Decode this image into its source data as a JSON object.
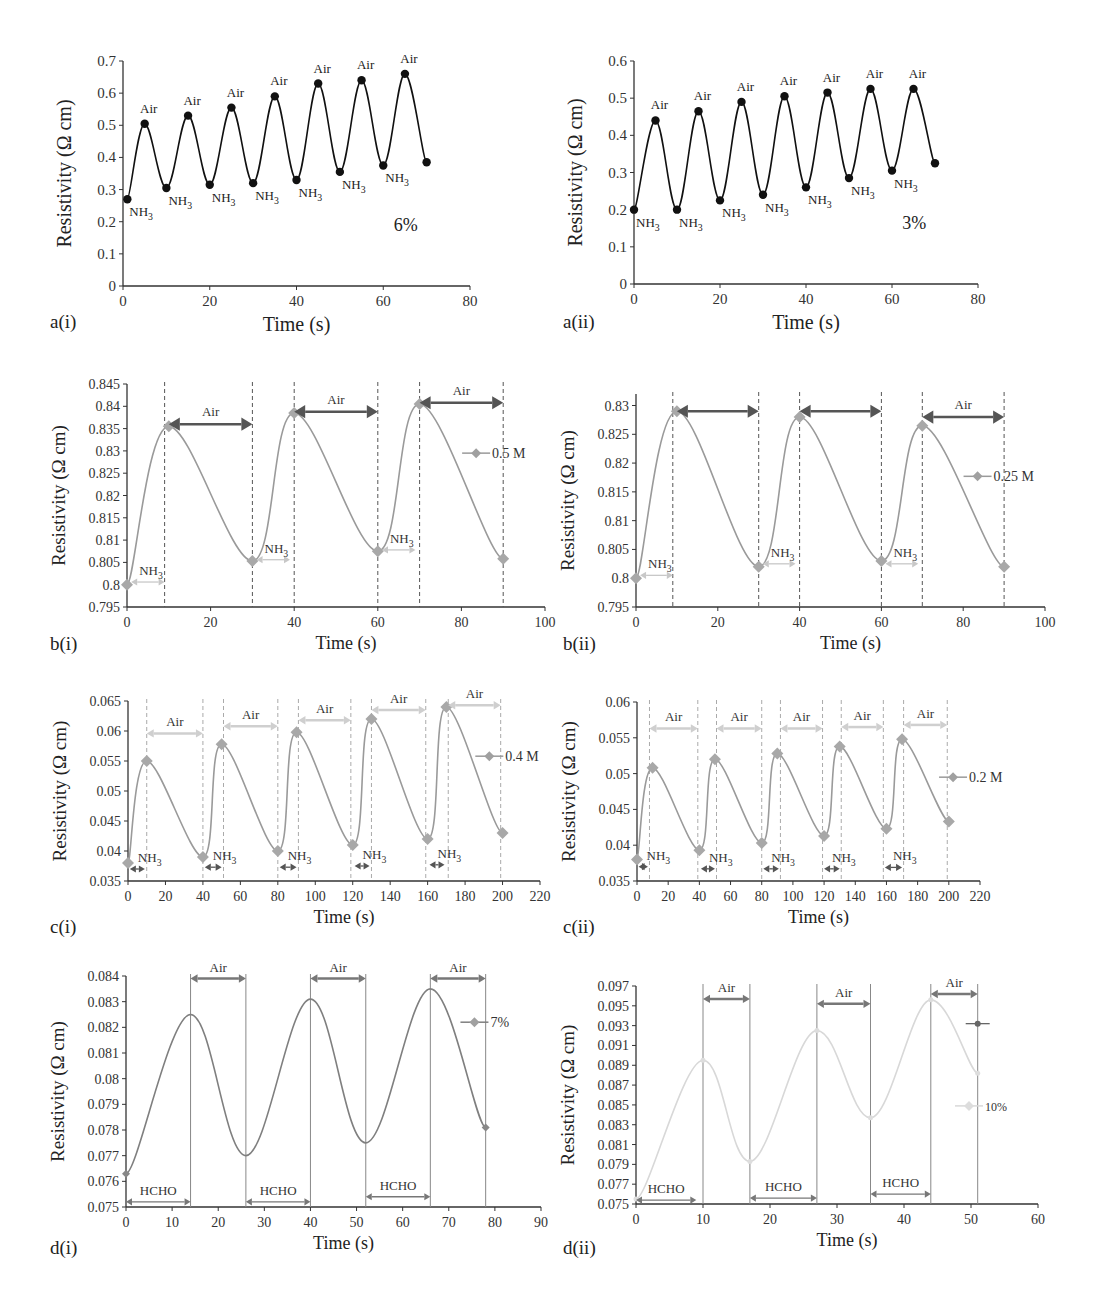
{
  "figure": {
    "panels": [
      "a(i)",
      "a(ii)",
      "b(i)",
      "b(ii)",
      "c(i)",
      "c(ii)",
      "d(i)",
      "d(ii)"
    ]
  },
  "chart_data": [
    {
      "id": "a-i",
      "panel_label": "a(i)",
      "type": "line",
      "style": "black-dots",
      "title": "",
      "annotation": "6%",
      "xlabel": "Time (s)",
      "ylabel": "Resistivity (Ω cm)",
      "xlim": [
        0,
        80
      ],
      "ylim": [
        0,
        0.7
      ],
      "xticks": [
        0,
        20,
        40,
        60,
        80
      ],
      "yticks": [
        0,
        0.1,
        0.2,
        0.3,
        0.4,
        0.5,
        0.6,
        0.7
      ],
      "ytick_labels": [
        "0",
        "0.1",
        "0.2",
        "0.3",
        "0.4",
        "0.5",
        "0.6",
        "0.7"
      ],
      "x": [
        1,
        5,
        10,
        15,
        20,
        25,
        30,
        35,
        40,
        45,
        50,
        55,
        60,
        65,
        70
      ],
      "values": [
        0.27,
        0.505,
        0.305,
        0.53,
        0.315,
        0.555,
        0.32,
        0.59,
        0.33,
        0.63,
        0.355,
        0.64,
        0.375,
        0.66,
        0.385
      ],
      "point_labels": [
        "NH3",
        "Air",
        "NH3",
        "Air",
        "NH3",
        "Air",
        "NH3",
        "Air",
        "NH3",
        "Air",
        "NH3",
        "Air",
        "NH3",
        "Air",
        ""
      ],
      "legend": [],
      "box": {
        "x0": 123,
        "x1": 470,
        "y0": 61,
        "y1": 286
      },
      "label_pos": {
        "x": 50,
        "y": 328
      },
      "color": "#111111"
    },
    {
      "id": "a-ii",
      "panel_label": "a(ii)",
      "type": "line",
      "style": "black-dots",
      "annotation": "3%",
      "xlabel": "Time (s)",
      "ylabel": "Resistivity (Ω cm)",
      "xlim": [
        0,
        80
      ],
      "ylim": [
        0,
        0.6
      ],
      "xticks": [
        0,
        20,
        40,
        60,
        80
      ],
      "yticks": [
        0,
        0.1,
        0.2,
        0.3,
        0.4,
        0.5,
        0.6
      ],
      "ytick_labels": [
        "0",
        "0.1",
        "0.2",
        "0.3",
        "0.4",
        "0.5",
        "0.6"
      ],
      "x": [
        0,
        5,
        10,
        15,
        20,
        25,
        30,
        35,
        40,
        45,
        50,
        55,
        60,
        65,
        70
      ],
      "values": [
        0.2,
        0.44,
        0.2,
        0.465,
        0.225,
        0.49,
        0.24,
        0.505,
        0.26,
        0.515,
        0.285,
        0.525,
        0.305,
        0.525,
        0.325
      ],
      "point_labels": [
        "NH3",
        "Air",
        "NH3",
        "Air",
        "NH3",
        "Air",
        "NH3",
        "Air",
        "NH3",
        "Air",
        "NH3",
        "Air",
        "NH3",
        "Air",
        ""
      ],
      "legend": [],
      "box": {
        "x0": 634,
        "x1": 978,
        "y0": 61,
        "y1": 284
      },
      "label_pos": {
        "x": 563,
        "y": 328
      },
      "color": "#111111"
    },
    {
      "id": "b-i",
      "panel_label": "b(i)",
      "type": "line",
      "style": "grey-diamonds",
      "xlabel": "Time (s)",
      "ylabel": "Resistivity (Ω cm)",
      "xlim": [
        0,
        100
      ],
      "ylim": [
        0.795,
        0.845
      ],
      "xticks": [
        0,
        20,
        40,
        60,
        80,
        100
      ],
      "yticks": [
        0.795,
        0.8,
        0.805,
        0.81,
        0.815,
        0.82,
        0.825,
        0.83,
        0.835,
        0.84,
        0.845
      ],
      "ytick_labels": [
        "0.795",
        "0.8",
        "0.805",
        "0.81",
        "0.815",
        "0.82",
        "0.825",
        "0.83",
        "0.835",
        "0.84",
        "0.845"
      ],
      "x": [
        0,
        10,
        30,
        40,
        60,
        70,
        90
      ],
      "values": [
        0.8,
        0.8355,
        0.8053,
        0.8385,
        0.8075,
        0.8405,
        0.8058
      ],
      "vlines": [
        9,
        30,
        40,
        60,
        70,
        90
      ],
      "air_spans": [
        {
          "from": 10,
          "to": 30,
          "y": 0.836,
          "label": "Air"
        },
        {
          "from": 40,
          "to": 60,
          "y": 0.8388,
          "label": "Air"
        },
        {
          "from": 70,
          "to": 90,
          "y": 0.8408,
          "label": "Air"
        }
      ],
      "gas_spans": [
        {
          "from": 1,
          "to": 9,
          "y": 0.8006,
          "label": "NH3"
        },
        {
          "from": 31,
          "to": 39,
          "y": 0.8056,
          "label": "NH3"
        },
        {
          "from": 61,
          "to": 69,
          "y": 0.8078,
          "label": "NH3"
        }
      ],
      "legend": [
        {
          "name": "0.5 M",
          "x": 84,
          "y": 0.8295
        }
      ],
      "box": {
        "x0": 127,
        "x1": 545,
        "y0": 384,
        "y1": 607
      },
      "label_pos": {
        "x": 50,
        "y": 650
      },
      "color": "#9a9a9a",
      "air_color": "#555555",
      "gas_color": "#c8c8c8"
    },
    {
      "id": "b-ii",
      "panel_label": "b(ii)",
      "type": "line",
      "style": "grey-diamonds",
      "xlabel": "Time (s)",
      "ylabel": "Resistivity (Ω cm)",
      "xlim": [
        0,
        100
      ],
      "ylim": [
        0.795,
        0.832
      ],
      "xticks": [
        0,
        20,
        40,
        60,
        80,
        100
      ],
      "yticks": [
        0.795,
        0.8,
        0.805,
        0.81,
        0.815,
        0.82,
        0.825,
        0.83
      ],
      "ytick_labels": [
        "0.795",
        "0.8",
        "0.805",
        "0.81",
        "0.815",
        "0.82",
        "0.825",
        "0.83"
      ],
      "x": [
        0,
        10,
        30,
        40,
        60,
        70,
        90
      ],
      "values": [
        0.8,
        0.829,
        0.802,
        0.828,
        0.803,
        0.8265,
        0.802
      ],
      "vlines": [
        9,
        30,
        40,
        60,
        70,
        90
      ],
      "air_spans": [
        {
          "from": 10,
          "to": 30,
          "y": 0.829,
          "label": ""
        },
        {
          "from": 40,
          "to": 60,
          "y": 0.829,
          "label": ""
        },
        {
          "from": 70,
          "to": 90,
          "y": 0.828,
          "label": "Air"
        }
      ],
      "gas_spans": [
        {
          "from": 1,
          "to": 9,
          "y": 0.8005,
          "label": "NH3"
        },
        {
          "from": 31,
          "to": 39,
          "y": 0.8025,
          "label": "NH3"
        },
        {
          "from": 61,
          "to": 69,
          "y": 0.8025,
          "label": "NH3"
        }
      ],
      "legend": [
        {
          "name": "0.25 M",
          "x": 84,
          "y": 0.8177
        }
      ],
      "box": {
        "x0": 636,
        "x1": 1045,
        "y0": 394,
        "y1": 607
      },
      "label_pos": {
        "x": 563,
        "y": 650
      },
      "color": "#9a9a9a",
      "air_color": "#555555",
      "gas_color": "#c8c8c8"
    },
    {
      "id": "c-i",
      "panel_label": "c(i)",
      "type": "line",
      "style": "grey-diamonds",
      "xlabel": "Time (s)",
      "ylabel": "Resistivity (Ω cm)",
      "xlim": [
        0,
        220
      ],
      "ylim": [
        0.035,
        0.065
      ],
      "xticks": [
        0,
        20,
        40,
        60,
        80,
        100,
        120,
        140,
        160,
        180,
        200,
        220
      ],
      "yticks": [
        0.035,
        0.04,
        0.045,
        0.05,
        0.055,
        0.06,
        0.065
      ],
      "ytick_labels": [
        "0.035",
        "0.04",
        "0.045",
        "0.05",
        "0.055",
        "0.06",
        "0.065"
      ],
      "x": [
        0,
        10,
        40,
        50,
        80,
        90,
        120,
        130,
        160,
        170,
        200
      ],
      "values": [
        0.038,
        0.055,
        0.039,
        0.0578,
        0.04,
        0.0598,
        0.041,
        0.062,
        0.042,
        0.064,
        0.043
      ],
      "vlines": [
        10,
        40,
        51,
        80,
        91,
        119,
        130,
        159,
        171,
        199
      ],
      "air_spans": [
        {
          "from": 10,
          "to": 40,
          "y": 0.0596,
          "label": "Air"
        },
        {
          "from": 51,
          "to": 80,
          "y": 0.0608,
          "label": "Air"
        },
        {
          "from": 91,
          "to": 119,
          "y": 0.0618,
          "label": "Air"
        },
        {
          "from": 130,
          "to": 159,
          "y": 0.0635,
          "label": "Air"
        },
        {
          "from": 171,
          "to": 199,
          "y": 0.0643,
          "label": "Air"
        }
      ],
      "gas_spans": [
        {
          "from": 1,
          "to": 9,
          "y": 0.037,
          "label": "NH3"
        },
        {
          "from": 41,
          "to": 50,
          "y": 0.0373,
          "label": "NH3"
        },
        {
          "from": 81,
          "to": 90,
          "y": 0.0373,
          "label": "NH3"
        },
        {
          "from": 121,
          "to": 129,
          "y": 0.0375,
          "label": "NH3"
        },
        {
          "from": 161,
          "to": 169,
          "y": 0.0377,
          "label": "NH3"
        }
      ],
      "legend": [
        {
          "name": "0.4 M",
          "x": 194,
          "y": 0.0558
        }
      ],
      "box": {
        "x0": 128,
        "x1": 540,
        "y0": 701,
        "y1": 881
      },
      "label_pos": {
        "x": 50,
        "y": 933
      },
      "color": "#9a9a9a",
      "air_color": "#cfcfcf",
      "gas_color": "#555555"
    },
    {
      "id": "c-ii",
      "panel_label": "c(ii)",
      "type": "line",
      "style": "grey-diamonds",
      "xlabel": "Time (s)",
      "ylabel": "Resistivity (Ω cm)",
      "xlim": [
        0,
        220
      ],
      "ylim": [
        0.035,
        0.06
      ],
      "xticks": [
        0,
        20,
        40,
        60,
        80,
        100,
        120,
        140,
        160,
        180,
        200,
        220
      ],
      "yticks": [
        0.035,
        0.04,
        0.045,
        0.05,
        0.055,
        0.06
      ],
      "ytick_labels": [
        "0.035",
        "0.04",
        "0.045",
        "0.05",
        "0.055",
        "0.06"
      ],
      "x": [
        0,
        10,
        40,
        50,
        80,
        90,
        120,
        130,
        160,
        170,
        200
      ],
      "values": [
        0.038,
        0.0508,
        0.0393,
        0.052,
        0.0403,
        0.0528,
        0.0413,
        0.0538,
        0.0423,
        0.0548,
        0.0433
      ],
      "vlines": [
        8,
        39,
        51,
        80,
        92,
        119,
        131,
        158,
        171,
        199
      ],
      "air_spans": [
        {
          "from": 8,
          "to": 39,
          "y": 0.0563,
          "label": "Air"
        },
        {
          "from": 51,
          "to": 80,
          "y": 0.0563,
          "label": "Air"
        },
        {
          "from": 92,
          "to": 119,
          "y": 0.0563,
          "label": "Air"
        },
        {
          "from": 131,
          "to": 158,
          "y": 0.0565,
          "label": "Air"
        },
        {
          "from": 171,
          "to": 199,
          "y": 0.0568,
          "label": "Air"
        }
      ],
      "gas_spans": [
        {
          "from": 1,
          "to": 7,
          "y": 0.037,
          "label": "NH3"
        },
        {
          "from": 41,
          "to": 50,
          "y": 0.0367,
          "label": "NH3"
        },
        {
          "from": 81,
          "to": 91,
          "y": 0.0367,
          "label": "NH3"
        },
        {
          "from": 120,
          "to": 130,
          "y": 0.0367,
          "label": "NH3"
        },
        {
          "from": 159,
          "to": 170,
          "y": 0.0369,
          "label": "NH3"
        }
      ],
      "legend": [
        {
          "name": "0.2 M",
          "x": 204,
          "y": 0.0495
        }
      ],
      "box": {
        "x0": 637,
        "x1": 980,
        "y0": 702,
        "y1": 881
      },
      "label_pos": {
        "x": 563,
        "y": 933
      },
      "color": "#9a9a9a",
      "air_color": "#cfcfcf",
      "gas_color": "#555555"
    },
    {
      "id": "d-i",
      "panel_label": "d(i)",
      "type": "line",
      "style": "grey-line",
      "xlabel": "Time (s)",
      "ylabel": "Resistivity (Ω cm)",
      "xlim": [
        0,
        90
      ],
      "ylim": [
        0.075,
        0.084
      ],
      "xticks": [
        0,
        10,
        20,
        30,
        40,
        50,
        60,
        70,
        80,
        90
      ],
      "yticks": [
        0.075,
        0.076,
        0.077,
        0.078,
        0.079,
        0.08,
        0.081,
        0.082,
        0.083,
        0.084
      ],
      "ytick_labels": [
        "0.075",
        "0.076",
        "0.077",
        "0.078",
        "0.079",
        "0.08",
        "0.081",
        "0.082",
        "0.083",
        "0.084"
      ],
      "x": [
        0,
        14,
        26,
        40,
        52,
        66,
        78
      ],
      "values": [
        0.0763,
        0.0825,
        0.077,
        0.0831,
        0.0775,
        0.0835,
        0.0781
      ],
      "vlines": [
        14,
        26,
        40,
        52,
        66,
        78
      ],
      "air_spans": [
        {
          "from": 14,
          "to": 26,
          "y": 0.0839,
          "label": "Air"
        },
        {
          "from": 40,
          "to": 52,
          "y": 0.0839,
          "label": "Air"
        },
        {
          "from": 66,
          "to": 78,
          "y": 0.0839,
          "label": "Air"
        }
      ],
      "gas_spans": [
        {
          "from": 0,
          "to": 14,
          "y": 0.0752,
          "label": "HCHO"
        },
        {
          "from": 26,
          "to": 40,
          "y": 0.0752,
          "label": "HCHO"
        },
        {
          "from": 52,
          "to": 66,
          "y": 0.0754,
          "label": "HCHO"
        }
      ],
      "legend": [
        {
          "name": "7%",
          "x": 76,
          "y": 0.0822
        }
      ],
      "box": {
        "x0": 126,
        "x1": 541,
        "y0": 976,
        "y1": 1207
      },
      "label_pos": {
        "x": 50,
        "y": 1254
      },
      "color": "#7f7f7f",
      "air_color": "#777777",
      "gas_color": "#777777"
    },
    {
      "id": "d-ii",
      "panel_label": "d(ii)",
      "type": "line",
      "style": "light-line",
      "xlabel": "Time (s)",
      "ylabel": "Resistivity (Ω cm)",
      "xlim": [
        0,
        60
      ],
      "ylim": [
        0.075,
        0.097
      ],
      "xticks": [
        0,
        10,
        20,
        30,
        40,
        50,
        60
      ],
      "yticks": [
        0.075,
        0.077,
        0.079,
        0.081,
        0.083,
        0.085,
        0.087,
        0.089,
        0.091,
        0.093,
        0.095,
        0.097
      ],
      "ytick_labels": [
        "0.075",
        "0.077",
        "0.079",
        "0.081",
        "0.083",
        "0.085",
        "0.087",
        "0.089",
        "0.091",
        "0.093",
        "0.095",
        "0.097"
      ],
      "x": [
        0,
        10,
        17,
        27,
        35,
        44,
        51
      ],
      "values": [
        0.0755,
        0.0895,
        0.0793,
        0.0925,
        0.0837,
        0.0956,
        0.0882
      ],
      "vlines": [
        10,
        17,
        27,
        35,
        44,
        51
      ],
      "air_spans": [
        {
          "from": 10,
          "to": 17,
          "y": 0.0957,
          "label": "Air"
        },
        {
          "from": 27,
          "to": 35,
          "y": 0.0952,
          "label": "Air"
        },
        {
          "from": 44,
          "to": 51,
          "y": 0.0962,
          "label": "Air"
        }
      ],
      "gas_spans": [
        {
          "from": 0,
          "to": 9,
          "y": 0.0754,
          "label": "HCHO"
        },
        {
          "from": 17,
          "to": 27,
          "y": 0.0756,
          "label": "HCHO"
        },
        {
          "from": 35,
          "to": 44,
          "y": 0.076,
          "label": "HCHO"
        }
      ],
      "legend": [
        {
          "name": "10%",
          "x": 50,
          "y": 0.0849
        }
      ],
      "extra_marker": {
        "x": 51,
        "y": 0.0932
      },
      "box": {
        "x0": 636,
        "x1": 1038,
        "y0": 986,
        "y1": 1204
      },
      "label_pos": {
        "x": 563,
        "y": 1254
      },
      "color": "#d8d8d8",
      "air_color": "#777777",
      "gas_color": "#777777"
    }
  ]
}
